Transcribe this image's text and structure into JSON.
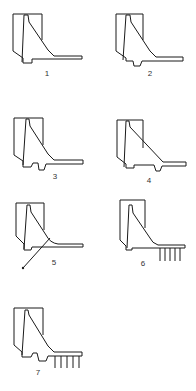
{
  "figure": {
    "colors": {
      "line": "#1a1a1a",
      "background": "#ffffff"
    },
    "panels": [
      {
        "id": 1,
        "label": "1",
        "features": [
          "plain base"
        ]
      },
      {
        "id": 2,
        "label": "2",
        "features": [
          "single shear key"
        ]
      },
      {
        "id": 3,
        "label": "3",
        "features": [
          "two shear keys"
        ]
      },
      {
        "id": 4,
        "label": "4",
        "features": [
          "stepped base",
          "shear key near toe"
        ]
      },
      {
        "id": 5,
        "label": "5",
        "features": [
          "curved fillet",
          "inclined anchor tie"
        ]
      },
      {
        "id": 6,
        "label": "6",
        "features": [
          "piles under toe"
        ]
      },
      {
        "id": 7,
        "label": "7",
        "features": [
          "two shear keys",
          "piles under toe"
        ]
      }
    ]
  }
}
